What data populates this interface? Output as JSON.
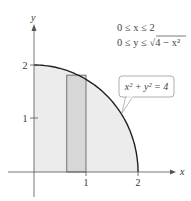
{
  "chart_data": {
    "type": "area",
    "title": "",
    "xlabel": "x",
    "ylabel": "y",
    "xlim": [
      -0.15,
      2.2
    ],
    "ylim": [
      -0.15,
      2.4
    ],
    "x_ticks": [
      {
        "value": 1,
        "label": "1"
      },
      {
        "value": 2,
        "label": "2"
      }
    ],
    "y_ticks": [
      {
        "value": 1,
        "label": "1"
      },
      {
        "value": 2,
        "label": "2"
      }
    ],
    "curve": {
      "name": "quarter circle",
      "equation": "x^2 + y^2 = 4",
      "radius": 2,
      "x_range": [
        0,
        2
      ]
    },
    "region": {
      "description": "quarter disk under the curve, shaded"
    },
    "rectangle": {
      "x_range": [
        0.63,
        1.0
      ],
      "height": 1.81,
      "description": "representative vertical strip"
    },
    "callout": {
      "label": "x² + y² = 4",
      "points_to_x": 1.7
    },
    "annotations": [
      "0 ≤ x ≤ 2",
      "0 ≤ y ≤ √(4 − x²)"
    ]
  },
  "labels": {
    "cond1": "0 ≤ x ≤ 2",
    "cond2": "0 ≤ y ≤ √4 − x²",
    "callout": "x² + y² = 4",
    "x_axis": "x",
    "y_axis": "y",
    "tick_x1": "1",
    "tick_x2": "2",
    "tick_y1": "1",
    "tick_y2": "2"
  },
  "colors": {
    "region_fill": "#ececec",
    "rect_fill": "#d7d7d7",
    "curve": "#222222",
    "axis": "#444444"
  }
}
